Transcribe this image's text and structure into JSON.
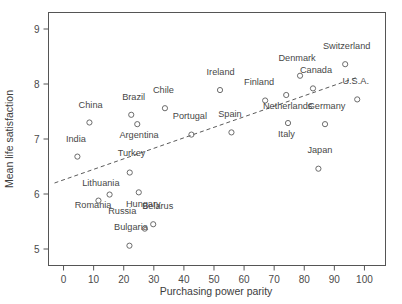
{
  "chart_data": {
    "type": "scatter",
    "title": "",
    "xlabel": "Purchasing power parity",
    "ylabel": "Mean life satisfaction",
    "xlim": [
      -5,
      107
    ],
    "ylim": [
      4.7,
      9.3
    ],
    "xticks": [
      0,
      10,
      20,
      30,
      40,
      50,
      60,
      70,
      80,
      90,
      100
    ],
    "yticks": [
      5,
      6,
      7,
      8,
      9
    ],
    "grid": false,
    "legend": "none",
    "marker_style": "open-circle",
    "trendline": {
      "style": "dashed",
      "x_start": -3,
      "y_start": 6.2,
      "x_end": 98,
      "y_end": 8.13
    },
    "points": [
      {
        "label": "India",
        "x": 4.6,
        "y": 6.68,
        "label_dx": -0.5,
        "label_dy": 0.26
      },
      {
        "label": "China",
        "x": 8.6,
        "y": 7.3,
        "label_dx": 0.4,
        "label_dy": 0.27
      },
      {
        "label": "Lithuania",
        "x": 11.6,
        "y": 5.88,
        "label_dx": 0.8,
        "label_dy": 0.27
      },
      {
        "label": "Romania",
        "x": 15.3,
        "y": 5.99,
        "label_dx": -5.5,
        "label_dy": -0.25
      },
      {
        "label": "Turkey",
        "x": 22.0,
        "y": 6.39,
        "label_dx": 0.6,
        "label_dy": 0.3
      },
      {
        "label": "Bulgaria",
        "x": 21.9,
        "y": 5.06,
        "label_dx": 0.5,
        "label_dy": 0.28
      },
      {
        "label": "Hungary",
        "x": 25.0,
        "y": 6.03,
        "label_dx": 1.5,
        "label_dy": -0.27
      },
      {
        "label": "Russia",
        "x": 27.0,
        "y": 5.37,
        "label_dx": -7.5,
        "label_dy": 0.27
      },
      {
        "label": "Brazil",
        "x": 22.5,
        "y": 7.44,
        "label_dx": 0.8,
        "label_dy": 0.27
      },
      {
        "label": "Argentina",
        "x": 24.5,
        "y": 7.27,
        "label_dx": 0.6,
        "label_dy": -0.26
      },
      {
        "label": "Belarus",
        "x": 29.8,
        "y": 5.45,
        "label_dx": 1.5,
        "label_dy": 0.27
      },
      {
        "label": "Chile",
        "x": 33.7,
        "y": 7.56,
        "label_dx": -0.5,
        "label_dy": 0.27
      },
      {
        "label": "Portugal",
        "x": 42.5,
        "y": 7.08,
        "label_dx": -0.5,
        "label_dy": 0.28
      },
      {
        "label": "Ireland",
        "x": 52.0,
        "y": 7.89,
        "label_dx": 0.2,
        "label_dy": 0.28
      },
      {
        "label": "Spain",
        "x": 55.8,
        "y": 7.12,
        "label_dx": -0.5,
        "label_dy": 0.28
      },
      {
        "label": "Finland",
        "x": 67.0,
        "y": 7.7,
        "label_dx": -2.0,
        "label_dy": 0.28
      },
      {
        "label": "Netherlands",
        "x": 74.0,
        "y": 7.8,
        "label_dx": 0.5,
        "label_dy": -0.26
      },
      {
        "label": "Italy",
        "x": 74.6,
        "y": 7.29,
        "label_dx": -0.5,
        "label_dy": -0.26
      },
      {
        "label": "Denmark",
        "x": 78.6,
        "y": 8.15,
        "label_dx": -1.0,
        "label_dy": 0.27
      },
      {
        "label": "Japan",
        "x": 84.7,
        "y": 6.46,
        "label_dx": 0.5,
        "label_dy": 0.29
      },
      {
        "label": "Canada",
        "x": 82.9,
        "y": 7.92,
        "label_dx": 1.0,
        "label_dy": 0.28
      },
      {
        "label": "Germany",
        "x": 86.9,
        "y": 7.27,
        "label_dx": 0.5,
        "label_dy": 0.28
      },
      {
        "label": "Switzerland",
        "x": 93.6,
        "y": 8.36,
        "label_dx": 0.5,
        "label_dy": 0.27
      },
      {
        "label": "U.S.A.",
        "x": 97.6,
        "y": 7.72,
        "label_dx": -0.5,
        "label_dy": 0.28
      }
    ]
  }
}
